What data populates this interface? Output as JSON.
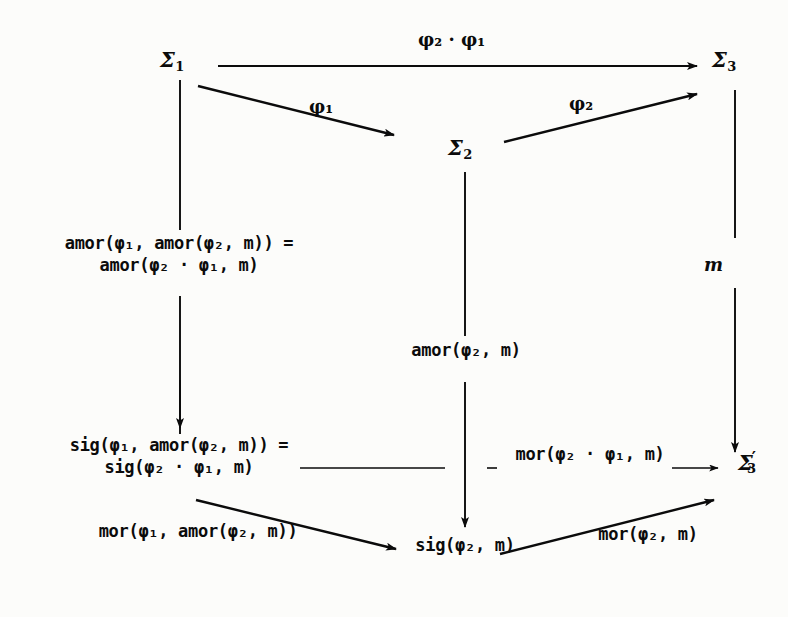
{
  "diagram": {
    "background": "#fdfdfb",
    "ink": "#0b0b0b",
    "nodes": [
      {
        "id": "sigma1",
        "base": "Σ",
        "sub": "1",
        "prime": "",
        "x": 160,
        "y": 46
      },
      {
        "id": "sigma2",
        "base": "Σ",
        "sub": "2",
        "prime": "",
        "x": 448,
        "y": 134
      },
      {
        "id": "sigma3",
        "base": "Σ",
        "sub": "3",
        "prime": "",
        "x": 712,
        "y": 46
      },
      {
        "id": "sigma3prime",
        "base": "Σ",
        "sub": "3",
        "prime": "′",
        "x": 738,
        "y": 447
      }
    ],
    "arrow_labels": [
      {
        "id": "phi2phi1",
        "text": "φ₂ · φ₁",
        "x": 418,
        "y": 28
      },
      {
        "id": "phi1",
        "text": "φ₁",
        "x": 309,
        "y": 95
      },
      {
        "id": "phi2",
        "text": "φ₂",
        "x": 569,
        "y": 92
      },
      {
        "id": "m",
        "text": "m",
        "x": 704,
        "y": 253
      }
    ],
    "expressions": [
      {
        "id": "amor-equality",
        "x": 38,
        "y": 232,
        "width": 282,
        "lines": [
          "amor(φ₁, amor(φ₂, m)) =",
          "amor(φ₂ · φ₁, m)"
        ]
      },
      {
        "id": "amor-center",
        "x": 386,
        "y": 339,
        "width": 160,
        "lines": [
          "amor(φ₂, m)"
        ]
      },
      {
        "id": "sig-equality",
        "x": 38,
        "y": 434,
        "width": 282,
        "lines": [
          "sig(φ₁, amor(φ₂, m)) =",
          "sig(φ₂ · φ₁, m)"
        ]
      },
      {
        "id": "mor-composite",
        "x": 505,
        "y": 443,
        "width": 170,
        "lines": [
          "mor(φ₂ · φ₁, m)"
        ]
      },
      {
        "id": "mor-phi1",
        "x": 78,
        "y": 520,
        "width": 240,
        "lines": [
          "mor(φ₁, amor(φ₂, m))"
        ]
      },
      {
        "id": "sig-phi2",
        "x": 390,
        "y": 534,
        "width": 150,
        "lines": [
          "sig(φ₂, m)"
        ]
      },
      {
        "id": "mor-phi2",
        "x": 578,
        "y": 523,
        "width": 140,
        "lines": [
          "mor(φ₂, m)"
        ]
      }
    ],
    "arrows": [
      {
        "id": "sigma1-to-sigma3",
        "kind": "horizontal",
        "x1": 218,
        "y1": 66,
        "x2": 699,
        "y2": 66
      },
      {
        "id": "sigma1-to-sigma2",
        "kind": "diagonal",
        "x1": 198,
        "y1": 86,
        "x2": 396,
        "y2": 136
      },
      {
        "id": "sigma2-to-sigma3",
        "kind": "diagonal",
        "x1": 504,
        "y1": 141,
        "x2": 699,
        "y2": 93
      },
      {
        "id": "sigma1-down",
        "kind": "vertical",
        "x1": 180,
        "y1": 80,
        "x2": 180,
        "y2": 427
      },
      {
        "id": "sigma2-down",
        "kind": "vertical",
        "x1": 465,
        "y1": 170,
        "x2": 465,
        "y2": 527
      },
      {
        "id": "sigma3-down",
        "kind": "vertical",
        "x1": 735,
        "y1": 90,
        "x2": 735,
        "y2": 452
      },
      {
        "id": "sig-to-sigma3prime",
        "kind": "horizontal-dashed",
        "x1": 300,
        "y1": 468,
        "x2": 720,
        "y2": 468
      },
      {
        "id": "sig-diag-to-center",
        "kind": "diagonal",
        "x1": 196,
        "y1": 500,
        "x2": 398,
        "y2": 549
      },
      {
        "id": "center-to-sigma3prime",
        "kind": "diagonal",
        "x1": 500,
        "y1": 554,
        "x2": 716,
        "y2": 499
      }
    ]
  }
}
